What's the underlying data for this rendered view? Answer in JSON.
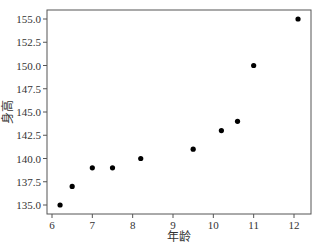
{
  "chart_data": {
    "type": "scatter",
    "title": "",
    "xlabel": "年龄",
    "ylabel": "身高",
    "xlim": [
      5.9,
      12.45
    ],
    "ylim": [
      134.0,
      156.0
    ],
    "xticks": [
      6,
      7,
      8,
      9,
      10,
      11,
      12
    ],
    "xtick_labels": [
      "6",
      "7",
      "8",
      "9",
      "10",
      "11",
      "12"
    ],
    "yticks": [
      135.0,
      137.5,
      140.0,
      142.5,
      145.0,
      147.5,
      150.0,
      152.5,
      155.0
    ],
    "ytick_labels": [
      "135.0",
      "137.5",
      "140.0",
      "142.5",
      "145.0",
      "147.5",
      "150.0",
      "152.5",
      "155.0"
    ],
    "grid": false,
    "legend": null,
    "marker_color": "#000000",
    "x": [
      6.2,
      6.5,
      7.0,
      7.5,
      8.2,
      9.5,
      10.2,
      10.6,
      11.0,
      12.1
    ],
    "y": [
      135,
      137,
      139,
      139,
      140,
      141,
      143,
      144,
      150,
      155
    ]
  }
}
